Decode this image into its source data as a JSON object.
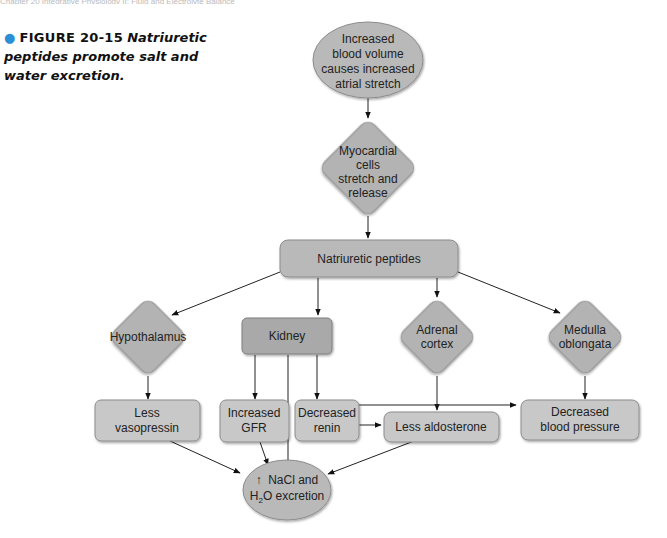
{
  "header": {
    "running_text": "Chapter 20 Integrative Physiology II: Fluid and Electrolyte Balance"
  },
  "caption": {
    "bullet": "●",
    "figure_label": "FIGURE 20-15",
    "title": "Natriuretic peptides promote salt and water excretion."
  },
  "nodes": {
    "stimulus": {
      "lines": [
        "Increased",
        "blood volume",
        "causes increased",
        "atrial stretch"
      ]
    },
    "myocardial": {
      "lines": [
        "Myocardial",
        "cells",
        "stretch and",
        "release"
      ]
    },
    "peptides": {
      "lines": [
        "Natriuretic peptides"
      ]
    },
    "hypothalamus": {
      "lines": [
        "Hypothalamus"
      ]
    },
    "kidney": {
      "lines": [
        "Kidney"
      ]
    },
    "adrenal": {
      "lines": [
        "Adrenal",
        "cortex"
      ]
    },
    "medulla": {
      "lines": [
        "Medulla",
        "oblongata"
      ]
    },
    "vasopressin": {
      "lines": [
        "Less",
        "vasopressin"
      ]
    },
    "gfr": {
      "lines": [
        "Increased",
        "GFR"
      ]
    },
    "renin": {
      "lines": [
        "Decreased",
        "renin"
      ]
    },
    "aldosterone": {
      "lines": [
        "Less aldosterone"
      ]
    },
    "bp": {
      "lines": [
        "Decreased",
        "blood pressure"
      ]
    },
    "excretion": {
      "line1": "NaCl and",
      "line2_pre": "H",
      "line2_sub": "2",
      "line2_post": "O excretion",
      "arrow": "↑"
    }
  },
  "colors": {
    "stimulus_fill": "#b9b9b9",
    "integrator_fill": "#b3b3b3",
    "target_fill": "#a9a9a9",
    "response_fill": "#c8c8c8",
    "accent": "#2b8fd6"
  }
}
